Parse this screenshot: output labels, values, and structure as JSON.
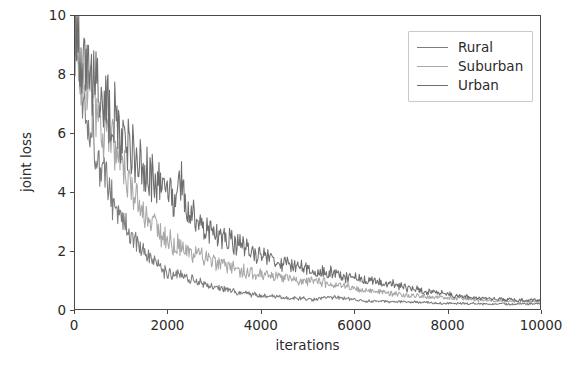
{
  "chart_data": {
    "type": "line",
    "title": "",
    "xlabel": "iterations",
    "ylabel": "joint loss",
    "xlim": [
      0,
      10000
    ],
    "ylim": [
      0,
      10
    ],
    "xticks": [
      0,
      2000,
      4000,
      6000,
      8000,
      10000
    ],
    "yticks": [
      0,
      2,
      4,
      6,
      8,
      10
    ],
    "xtick_labels": [
      "0",
      "2000",
      "4000",
      "6000",
      "8000",
      "10000"
    ],
    "ytick_labels": [
      "0",
      "2",
      "4",
      "6",
      "8",
      "10"
    ],
    "grid": false,
    "legend_position": "upper right",
    "annotations": [
      "Urban curve shows a sharp transient spike to about 4.7 near iteration 2250"
    ],
    "series": [
      {
        "name": "Rural",
        "color": "#7d7d7d",
        "x": [
          0,
          100,
          200,
          300,
          400,
          500,
          600,
          700,
          800,
          900,
          1000,
          1100,
          1200,
          1300,
          1400,
          1500,
          1600,
          1700,
          1800,
          1900,
          2000,
          2200,
          2400,
          2600,
          2800,
          3000,
          3200,
          3400,
          3600,
          3800,
          4000,
          4400,
          4800,
          5200,
          5600,
          6000,
          6400,
          6800,
          7200,
          7600,
          8000,
          8400,
          8800,
          9200,
          9600,
          10000
        ],
        "values": [
          9.2,
          7.9,
          7.2,
          6.6,
          5.9,
          5.3,
          4.7,
          4.2,
          3.8,
          3.4,
          3.1,
          2.8,
          2.5,
          2.3,
          2.1,
          1.9,
          1.75,
          1.6,
          1.45,
          1.3,
          1.2,
          1.25,
          1.1,
          0.95,
          0.85,
          0.75,
          0.68,
          0.6,
          0.55,
          0.5,
          0.45,
          0.4,
          0.36,
          0.33,
          0.42,
          0.3,
          0.27,
          0.25,
          0.24,
          0.22,
          0.2,
          0.19,
          0.18,
          0.17,
          0.17,
          0.18
        ]
      },
      {
        "name": "Suburban",
        "color": "#a8a8a8",
        "x": [
          0,
          100,
          200,
          300,
          400,
          500,
          600,
          700,
          800,
          900,
          1000,
          1100,
          1200,
          1300,
          1400,
          1500,
          1600,
          1700,
          1800,
          1900,
          2000,
          2200,
          2400,
          2600,
          2800,
          3000,
          3200,
          3400,
          3600,
          3800,
          4000,
          4400,
          4800,
          5200,
          5600,
          6000,
          6400,
          6800,
          7200,
          7600,
          8000,
          8400,
          8800,
          9200,
          9600,
          10000
        ],
        "values": [
          9.5,
          8.6,
          8.1,
          7.7,
          7.2,
          6.6,
          6.2,
          5.9,
          5.5,
          5.1,
          4.7,
          4.4,
          4.1,
          3.8,
          3.5,
          3.25,
          3.05,
          2.9,
          2.7,
          2.55,
          2.4,
          2.2,
          2.0,
          1.85,
          1.7,
          1.6,
          1.5,
          1.4,
          1.3,
          1.25,
          1.2,
          1.1,
          1.0,
          0.95,
          0.85,
          0.7,
          0.6,
          0.52,
          0.46,
          0.42,
          0.38,
          0.34,
          0.3,
          0.28,
          0.26,
          0.25
        ]
      },
      {
        "name": "Urban",
        "color": "#6e6e6e",
        "x": [
          0,
          100,
          200,
          300,
          400,
          500,
          600,
          700,
          800,
          900,
          1000,
          1100,
          1200,
          1300,
          1400,
          1500,
          1600,
          1700,
          1800,
          1900,
          2000,
          2200,
          2250,
          2400,
          2600,
          2800,
          3000,
          3200,
          3400,
          3600,
          3800,
          4000,
          4400,
          4800,
          5200,
          5600,
          6000,
          6400,
          6800,
          7200,
          7600,
          8000,
          8400,
          8800,
          9200,
          9600,
          10000
        ],
        "values": [
          10.0,
          8.9,
          8.4,
          8.1,
          7.8,
          7.4,
          7.1,
          6.9,
          6.6,
          6.3,
          6.0,
          5.7,
          5.5,
          5.2,
          5.0,
          4.8,
          4.6,
          4.4,
          4.25,
          4.1,
          4.0,
          3.6,
          4.7,
          3.3,
          3.0,
          2.8,
          2.6,
          2.45,
          2.3,
          2.2,
          2.0,
          1.85,
          1.6,
          1.45,
          1.3,
          1.2,
          1.05,
          0.95,
          0.85,
          0.7,
          0.6,
          0.5,
          0.42,
          0.36,
          0.32,
          0.3,
          0.3
        ]
      }
    ]
  },
  "legend": {
    "items": [
      {
        "label": "Rural"
      },
      {
        "label": "Suburban"
      },
      {
        "label": "Urban"
      }
    ]
  }
}
